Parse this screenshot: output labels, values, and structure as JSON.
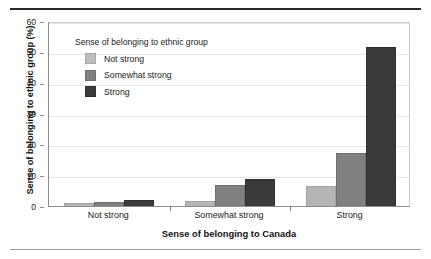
{
  "chart_data": {
    "type": "bar",
    "title": "",
    "subtitle": "",
    "xlabel": "Sense of belonging to Canada",
    "ylabel": "Sense of belonging to ethnic group (%)",
    "categories": [
      "Not strong",
      "Somewhat strong",
      "Strong"
    ],
    "series": [
      {
        "name": "Not strong",
        "color": "#b5b5b5",
        "values": [
          1.2,
          2.0,
          6.8
        ]
      },
      {
        "name": "Somewhat strong",
        "color": "#808080",
        "values": [
          1.5,
          7.0,
          17.5
        ]
      },
      {
        "name": "Strong",
        "color": "#3a3a3a",
        "values": [
          2.2,
          9.0,
          52.0
        ]
      }
    ],
    "ylim": [
      0,
      60
    ],
    "yticks": [
      0,
      10,
      20,
      30,
      40,
      50,
      60
    ],
    "ytick_labels": [
      "0",
      "10",
      "20",
      "30",
      "40",
      "50",
      "60"
    ],
    "grid": true,
    "legend_position": "inside-top-left",
    "legend_title": "Sense of belonging to ethnic group"
  },
  "legend": {
    "title": "Sense of belonging to ethnic group",
    "items": [
      {
        "label": "Not strong",
        "swatch": "light"
      },
      {
        "label": "Somewhat strong",
        "swatch": "medium"
      },
      {
        "label": "Strong",
        "swatch": "dark"
      }
    ]
  },
  "axes": {
    "y_title": "Sense of belonging to ethnic group (%)",
    "x_title": "Sense of belonging to Canada",
    "y_ticks": [
      "60",
      "50",
      "40",
      "30",
      "20",
      "10",
      "0"
    ],
    "x_ticks": [
      "Not strong",
      "Somewhat strong",
      "Strong"
    ]
  }
}
